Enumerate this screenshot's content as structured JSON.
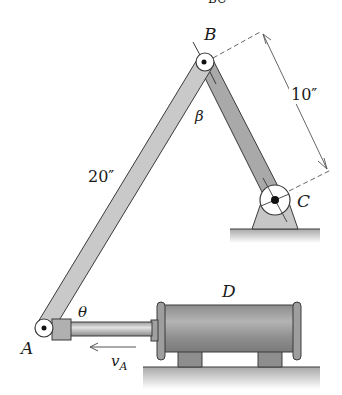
{
  "header_fragment": "BC",
  "labels": {
    "pin_b": "B",
    "pin_a": "A",
    "pin_c": "C",
    "cylinder_d": "D",
    "angle_beta": "β",
    "angle_theta": "θ",
    "length_ab": "20″",
    "length_bc": "10″",
    "velocity_main": "v",
    "velocity_sub": "A"
  },
  "colors": {
    "link_ab": "#c9c9c9",
    "link_bc": "#a9a9a9",
    "outline": "#3a3a3a",
    "cylinder": "#9a9a9a",
    "ground": "#bdbdbd",
    "dim_line": "#555555"
  }
}
